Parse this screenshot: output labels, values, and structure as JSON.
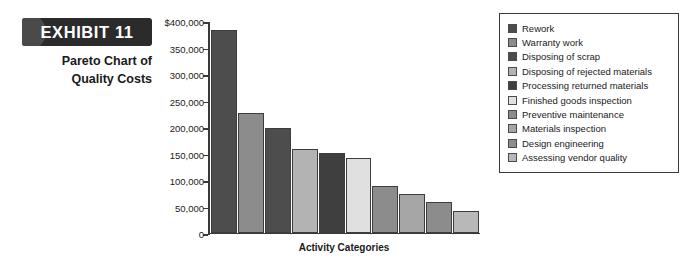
{
  "exhibit": {
    "badge_label": "EXHIBIT 11",
    "title": "Pareto Chart of\nQuality Costs"
  },
  "chart_data": {
    "type": "bar",
    "xlabel": "Activity Categories",
    "ylabel": "",
    "ylim": [
      0,
      400000
    ],
    "grid": false,
    "legend_position": "right",
    "y_ticks": [
      {
        "value": 400000,
        "label": "$400,000"
      },
      {
        "value": 350000,
        "label": "350,000"
      },
      {
        "value": 300000,
        "label": "300,000"
      },
      {
        "value": 250000,
        "label": "250,000"
      },
      {
        "value": 200000,
        "label": "200,000"
      },
      {
        "value": 150000,
        "label": "150,000"
      },
      {
        "value": 100000,
        "label": "100,000"
      },
      {
        "value": 50000,
        "label": "50,000"
      },
      {
        "value": 0,
        "label": "0"
      }
    ],
    "categories": [
      "Rework",
      "Warranty work",
      "Disposing of scrap",
      "Disposing of rejected materials",
      "Processing returned materials",
      "Finished goods inspection",
      "Preventive maintenance",
      "Materials inspection",
      "Design engineering",
      "Assessing vendor quality"
    ],
    "values": [
      383000,
      225000,
      198000,
      158000,
      150000,
      141000,
      88000,
      72000,
      58000,
      40000
    ],
    "colors": [
      "#4d4d4d",
      "#8c8c8c",
      "#4d4d4d",
      "#b3b3b3",
      "#3f3f3f",
      "#e0e0e0",
      "#8c8c8c",
      "#a6a6a6",
      "#8c8c8c",
      "#b8b8b8"
    ]
  },
  "legend": {
    "items": [
      {
        "label": "Rework",
        "color": "#4d4d4d"
      },
      {
        "label": "Warranty work",
        "color": "#8c8c8c"
      },
      {
        "label": "Disposing of scrap",
        "color": "#4d4d4d"
      },
      {
        "label": "Disposing of rejected materials",
        "color": "#b3b3b3"
      },
      {
        "label": "Processing returned materials",
        "color": "#3f3f3f"
      },
      {
        "label": "Finished goods inspection",
        "color": "#e0e0e0"
      },
      {
        "label": "Preventive maintenance",
        "color": "#8c8c8c"
      },
      {
        "label": "Materials inspection",
        "color": "#a6a6a6"
      },
      {
        "label": "Design engineering",
        "color": "#8c8c8c"
      },
      {
        "label": "Assessing vendor quality",
        "color": "#b8b8b8"
      }
    ]
  }
}
